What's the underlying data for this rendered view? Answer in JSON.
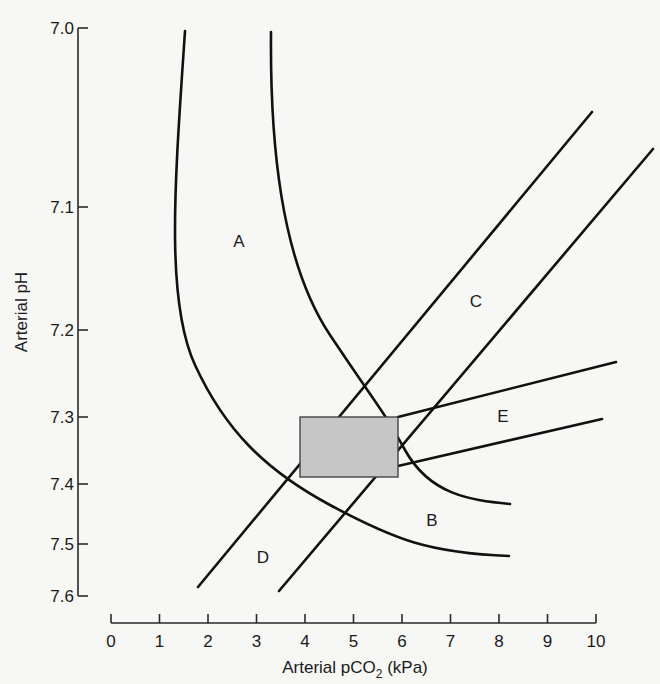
{
  "chart_data": {
    "type": "line",
    "title": "",
    "xlabel": "Arterial pCO2 (kPa)",
    "xlabel_main": "Arterial pCO",
    "xlabel_sub": "2",
    "xlabel_unit": " (kPa)",
    "ylabel": "Arterial pH",
    "xlim": [
      0,
      10
    ],
    "ylim": [
      7.0,
      7.6
    ],
    "y_inverted": true,
    "y_scale": "log [H+] (non-linear pH spacing)",
    "grid": false,
    "x_ticks": [
      "0",
      "1",
      "2",
      "3",
      "4",
      "5",
      "6",
      "7",
      "8",
      "9",
      "10"
    ],
    "y_ticks": [
      "7.0",
      "7.1",
      "7.2",
      "7.3",
      "7.4",
      "7.5",
      "7.6"
    ],
    "normal_range_box": {
      "label": "normal range",
      "pco2": [
        3.9,
        5.9
      ],
      "ph": [
        7.3,
        7.4
      ]
    },
    "regions": [
      {
        "label": "A",
        "description": "band between two left curves (upper)",
        "x": 2.6,
        "ph": 7.15
      },
      {
        "label": "B",
        "description": "band between two right curves (lower)",
        "x": 6.6,
        "ph": 7.47
      },
      {
        "label": "C",
        "description": "band between two diagonal lines (upper right)",
        "x": 7.5,
        "ph": 7.24
      },
      {
        "label": "D",
        "description": "band between two diagonal lines (lower left)",
        "x": 3.1,
        "ph": 7.52
      },
      {
        "label": "E",
        "description": "band between two shallow lines (right)",
        "x": 8.1,
        "ph": 7.33
      }
    ],
    "series": [
      {
        "name": "curve-1 (A/B outer)",
        "points": [
          [
            1.5,
            7.0
          ],
          [
            1.4,
            7.1
          ],
          [
            2.0,
            7.25
          ],
          [
            3.5,
            7.37
          ],
          [
            5.0,
            7.47
          ],
          [
            8.2,
            7.52
          ]
        ]
      },
      {
        "name": "curve-2 (A/B inner)",
        "points": [
          [
            3.3,
            7.0
          ],
          [
            3.5,
            7.1
          ],
          [
            4.2,
            7.22
          ],
          [
            5.0,
            7.3
          ],
          [
            6.3,
            7.38
          ],
          [
            8.2,
            7.44
          ]
        ]
      },
      {
        "name": "line-1 (C/D left)",
        "points": [
          [
            1.8,
            7.58
          ],
          [
            10.0,
            7.07
          ]
        ]
      },
      {
        "name": "line-2 (C/D right)",
        "points": [
          [
            3.5,
            7.59
          ],
          [
            11.2,
            7.1
          ]
        ]
      },
      {
        "name": "line-3 (E upper)",
        "points": [
          [
            5.9,
            7.3
          ],
          [
            10.4,
            7.24
          ]
        ]
      },
      {
        "name": "line-4 (E lower)",
        "points": [
          [
            5.9,
            7.37
          ],
          [
            10.1,
            7.31
          ]
        ]
      }
    ]
  },
  "layout": {
    "y_axis_x": 78,
    "y_tick_pixels": [
      28,
      207,
      330,
      417,
      484,
      544,
      596
    ],
    "x_axis_y": 623,
    "x_tick_pixels": [
      111,
      159.5,
      208,
      256.5,
      305,
      353.5,
      402,
      450.5,
      499,
      547.5,
      596
    ],
    "box_px": {
      "x": 300,
      "y": 417,
      "w": 98,
      "h": 60
    },
    "curves_px": [
      "M185,31 C175,180 165,300 195,365 S265,470 330,505 S430,553 509,556",
      "M271,32 C270,140 280,260 330,335 S380,405 405,450 S470,500 510,504",
      "M198,587 L592,112",
      "M279,591 L653,149",
      "M398,417 L616,362",
      "M398,466 L602,419"
    ],
    "labels_px": {
      "A": [
        239,
        247
      ],
      "B": [
        432,
        526
      ],
      "C": [
        476,
        307
      ],
      "D": [
        263,
        563
      ],
      "E": [
        503,
        422
      ]
    }
  }
}
